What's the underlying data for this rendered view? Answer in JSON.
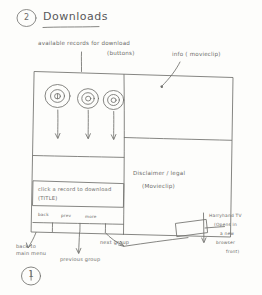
{
  "page": {
    "step_number_top": "2",
    "step_number_bottom": "1",
    "title": "Downloads"
  },
  "annotations": {
    "records_label_line1": "available records for download",
    "records_label_line2": "(buttons)",
    "info_label": "info ( movieclip)",
    "disclaimer_line1": "Disclaimer / legal",
    "disclaimer_line2": "(Movieclip)",
    "click_record_line1": "click a record to download",
    "click_record_line2": "(TITLE)",
    "back_to_main_line1": "back to",
    "back_to_main_line2": "main menu",
    "previous_group": "previous group",
    "next_group": "next group",
    "tv_note_line1": "Harryhand TV",
    "tv_note_line2": "(Opens in",
    "tv_note_line3": "a new",
    "tv_note_line4": "browser",
    "tv_note_line5": "front)"
  },
  "wireframe": {
    "nav_back": "back",
    "nav_prev": "prev",
    "nav_more": "more",
    "record_buttons": [
      {
        "name": "record-button-1"
      },
      {
        "name": "record-button-2"
      },
      {
        "name": "record-button-3"
      }
    ],
    "logo_box": "logo"
  },
  "colors": {
    "ink": "#6f6f6c",
    "paper": "#fdfdfb",
    "text": "#6b6b68"
  }
}
